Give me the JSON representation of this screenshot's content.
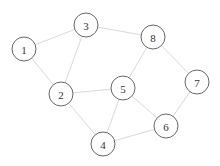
{
  "graph": {
    "node_radius": 12,
    "colors": {
      "edge": "#d9d9d9",
      "node_stroke": "#666666",
      "node_fill": "#ffffff",
      "label": "#333333"
    },
    "nodes": [
      {
        "id": "1",
        "label": "1",
        "x": 24,
        "y": 49
      },
      {
        "id": "2",
        "label": "2",
        "x": 61,
        "y": 94
      },
      {
        "id": "3",
        "label": "3",
        "x": 86,
        "y": 25
      },
      {
        "id": "4",
        "label": "4",
        "x": 103,
        "y": 144
      },
      {
        "id": "5",
        "label": "5",
        "x": 123,
        "y": 88
      },
      {
        "id": "6",
        "label": "6",
        "x": 166,
        "y": 126
      },
      {
        "id": "7",
        "label": "7",
        "x": 197,
        "y": 82
      },
      {
        "id": "8",
        "label": "8",
        "x": 153,
        "y": 37
      }
    ],
    "edges": [
      [
        "1",
        "3"
      ],
      [
        "1",
        "2"
      ],
      [
        "3",
        "2"
      ],
      [
        "3",
        "8"
      ],
      [
        "8",
        "5"
      ],
      [
        "8",
        "7"
      ],
      [
        "7",
        "6"
      ],
      [
        "2",
        "5"
      ],
      [
        "2",
        "4"
      ],
      [
        "5",
        "4"
      ],
      [
        "5",
        "6"
      ],
      [
        "4",
        "6"
      ]
    ]
  }
}
